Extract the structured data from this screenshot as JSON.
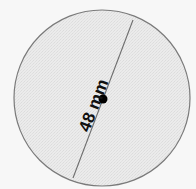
{
  "figure": {
    "background_color": "#f7f7f7",
    "shape": {
      "name": "circle",
      "fill_color": "#e9e9e9",
      "stroke_color": "#7a7a7a",
      "center_x": 102,
      "center_y": 98,
      "radius": 88
    },
    "diameter_line": {
      "stroke_color": "#6e6e6e",
      "x1": 133,
      "y1": 20,
      "x2": 73,
      "y2": 178
    },
    "center_dot": {
      "color": "#000000",
      "x": 103,
      "y": 99,
      "radius": 4.5
    },
    "label": {
      "text": "48 mm",
      "value": "48",
      "unit": "mm",
      "color": "#111111",
      "rotation_deg": -69,
      "x": 76,
      "y": 128
    }
  },
  "chart_data": {
    "type": "diagram",
    "shape": "circle",
    "measurements": [
      {
        "name": "diameter",
        "value": 48,
        "unit": "mm",
        "label": "48 mm"
      }
    ],
    "annotations": [
      "48 mm"
    ],
    "title": "",
    "xlabel": "",
    "ylabel": ""
  }
}
